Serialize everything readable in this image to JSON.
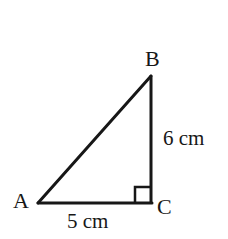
{
  "figure": {
    "type": "right-triangle-geometry-diagram",
    "background_color": "#ffffff",
    "stroke_color": "#171717",
    "stroke_width": 3,
    "canvas": {
      "width": 228,
      "height": 239
    }
  },
  "vertices": {
    "a": {
      "label": "A",
      "x": 38,
      "y": 203
    },
    "b": {
      "label": "B",
      "x": 151,
      "y": 76
    },
    "c": {
      "label": "C",
      "x": 151,
      "y": 202
    }
  },
  "sides": {
    "ac": {
      "label": "5 cm",
      "length": 5,
      "unit": "cm",
      "from": "A",
      "to": "C"
    },
    "bc": {
      "label": "6 cm",
      "length": 6,
      "unit": "cm",
      "from": "B",
      "to": "C"
    },
    "ab": {
      "label": "",
      "from": "A",
      "to": "B"
    }
  },
  "right_angle": {
    "at_vertex": "C",
    "marker": "square",
    "size": 15
  }
}
